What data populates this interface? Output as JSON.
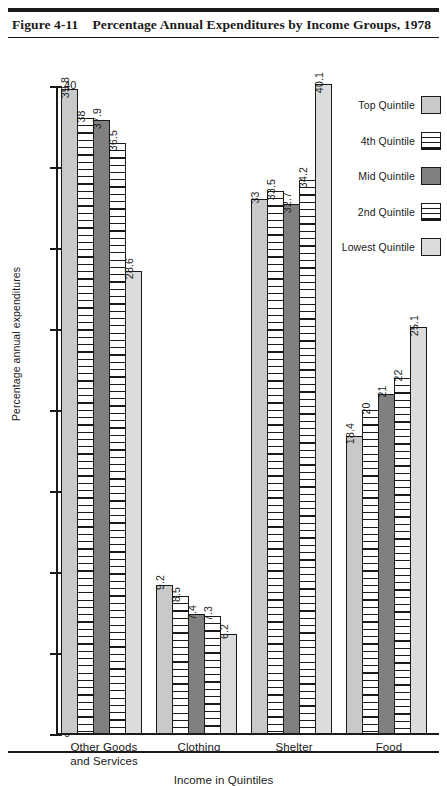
{
  "header": {
    "figure_number": "Figure 4-11",
    "title": "Percentage Annual Expenditures by Income Groups, 1978"
  },
  "legend": {
    "items": [
      {
        "label": "Top Quintile",
        "pattern": "solid-light"
      },
      {
        "label": "4th Quintile",
        "pattern": "stripe"
      },
      {
        "label": "Mid Quintile",
        "pattern": "solid-dark"
      },
      {
        "label": "2nd Quintile",
        "pattern": "stripe"
      },
      {
        "label": "Lowest Quintile",
        "pattern": "solid-lighter"
      }
    ]
  },
  "chart_data": {
    "type": "bar",
    "title": "Percentage Annual Expenditures by Income Groups, 1978",
    "xlabel": "Income in Quintiles",
    "ylabel": "Percentage annual expenditures",
    "ylim": [
      0,
      40
    ],
    "yticks": [
      0,
      5,
      10,
      15,
      20,
      25,
      30,
      35,
      40
    ],
    "ytick_labels": [
      "0",
      "5",
      "10",
      "15",
      "20",
      "25",
      "30",
      "35",
      "40"
    ],
    "grid": false,
    "legend_position": "top-right",
    "categories": [
      "Other Goods and Services",
      "Clothing",
      "Shelter",
      "Food"
    ],
    "category_lines": [
      [
        "Other Goods",
        "and Services"
      ],
      [
        "Clothing"
      ],
      [
        "Shelter"
      ],
      [
        "Food"
      ]
    ],
    "series": [
      {
        "name": "Top Quintile",
        "values": [
          39.8,
          9.2,
          33.0,
          18.4
        ],
        "labels": [
          "39.8",
          "9.2",
          "33",
          "18.4"
        ]
      },
      {
        "name": "4th Quintile",
        "values": [
          38.0,
          8.5,
          33.5,
          20.0
        ],
        "labels": [
          "38",
          "8.5",
          "33.5",
          "20"
        ]
      },
      {
        "name": "Mid Quintile",
        "values": [
          37.9,
          7.4,
          32.7,
          21.0
        ],
        "labels": [
          "37.9",
          "7.4",
          "32.7",
          "21"
        ]
      },
      {
        "name": "2nd Quintile",
        "values": [
          36.5,
          7.3,
          34.2,
          22.0
        ],
        "labels": [
          "36.5",
          "7.3",
          "34.2",
          "22"
        ]
      },
      {
        "name": "Lowest Quintile",
        "values": [
          28.6,
          6.2,
          40.1,
          25.1
        ],
        "labels": [
          "28.6",
          "6.2",
          "40.1",
          "25.1"
        ]
      }
    ]
  },
  "colors": {
    "solid_light": "#c9c9c9",
    "solid_lighter": "#dcdcdc",
    "solid_dark": "#808080",
    "outline": "#1a1a1a"
  }
}
